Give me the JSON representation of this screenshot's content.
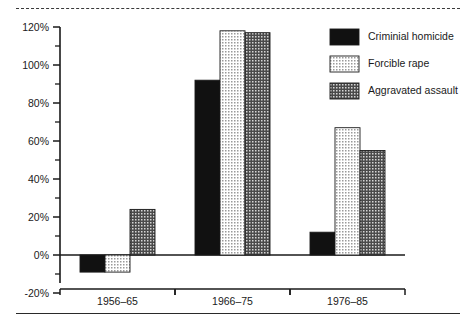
{
  "chart_data": {
    "type": "bar",
    "title": "",
    "subtitle": "",
    "xlabel": "",
    "ylabel": "",
    "categories": [
      "1956–65",
      "1966–75",
      "1976–85"
    ],
    "series": [
      {
        "name": "Criminial homicide",
        "values": [
          -9,
          92,
          12
        ],
        "fill": "solid-black",
        "color": "#111111"
      },
      {
        "name": "Forcible rape",
        "values": [
          -9,
          118,
          67
        ],
        "fill": "light-dots",
        "color": "#d8d8d8"
      },
      {
        "name": "Aggravated assault",
        "values": [
          24,
          117,
          55
        ],
        "fill": "dark-dots",
        "color": "#6e6e6e"
      }
    ],
    "ylim": [
      -20,
      120
    ],
    "y_tick_step": 20,
    "y_minor_tick_step": 10,
    "y_ticks": [
      "120%",
      "100%",
      "80%",
      "60%",
      "40%",
      "20%",
      "0%",
      "-20%"
    ],
    "y_tick_values": [
      120,
      100,
      80,
      60,
      40,
      20,
      0,
      -20
    ],
    "grid": false,
    "legend_position": "top-right",
    "baseline_value": 0,
    "axis_color": "#1a1a1a"
  },
  "frame": {
    "top_rule": "dashed",
    "bottom_rule": "solid"
  }
}
